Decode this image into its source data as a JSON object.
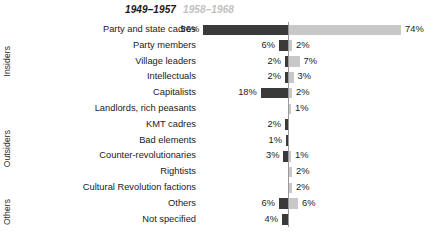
{
  "chart_data": {
    "type": "bar",
    "subtype": "diverging-horizontal-bar",
    "title": "",
    "xlabel": "",
    "ylabel": "",
    "grid": false,
    "legend_position": "top",
    "axis_center_percent": 0,
    "value_suffix": "%",
    "series": [
      {
        "name": "1949–1957",
        "color": "#3a3a3a",
        "direction": "left",
        "values": [
          56,
          6,
          2,
          2,
          18,
          null,
          2,
          1,
          3,
          null,
          null,
          6,
          4
        ],
        "labels": [
          "56%",
          "6%",
          "2%",
          "2%",
          "18%",
          "",
          "2%",
          "1%",
          "3%",
          "",
          "",
          "6%",
          "4%"
        ]
      },
      {
        "name": "1958–1968",
        "color": "#c8c8c8",
        "direction": "right",
        "values": [
          74,
          2,
          7,
          3,
          2,
          1,
          null,
          null,
          1,
          2,
          2,
          6,
          null
        ],
        "labels": [
          "74%",
          "2%",
          "7%",
          "3%",
          "2%",
          "1%",
          "",
          "",
          "1%",
          "2%",
          "2%",
          "6%",
          ""
        ]
      }
    ],
    "categories": [
      "Party and state cadres",
      "Party members",
      "Village leaders",
      "Intellectuals",
      "Capitalists",
      "Landlords, rich peasants",
      "KMT cadres",
      "Bad elements",
      "Counter-revolutionaries",
      "Rightists",
      "Cultural Revolution factions",
      "Others",
      "Not specified"
    ],
    "groups": [
      {
        "label": "Insiders",
        "start": 0,
        "end": 4
      },
      {
        "label": "Outsiders",
        "start": 5,
        "end": 10
      },
      {
        "label": "Others",
        "start": 11,
        "end": 12
      }
    ]
  },
  "colors": {
    "series_left": "#3a3a3a",
    "series_right": "#c8c8c8",
    "axis": "#9a9a9a",
    "text": "#1a1a1a",
    "header_right": "#c0c0c0",
    "background": "#ffffff"
  }
}
